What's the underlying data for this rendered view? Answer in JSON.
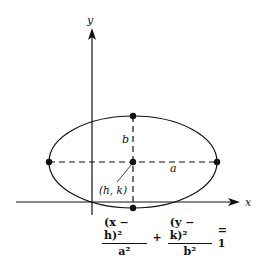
{
  "diagram": {
    "axes": {
      "x_label": "x",
      "y_label": "y"
    },
    "ellipse": {
      "center_label": "(h, k)",
      "semi_major_label": "a",
      "semi_minor_label": "b",
      "orientation": "horizontal major axis",
      "points": [
        "top vertex",
        "center",
        "bottom vertex",
        "left vertex",
        "right vertex"
      ]
    },
    "equation": {
      "term1_numerator": "(x − h)²",
      "term1_denominator": "a²",
      "plus": "+",
      "term2_numerator": "(y − k)²",
      "term2_denominator": "b²",
      "equals": "= 1"
    },
    "colors": {
      "ink": "#111111",
      "background": "#ffffff"
    }
  }
}
